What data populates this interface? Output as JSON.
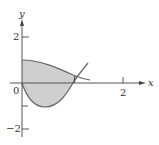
{
  "diagram": {
    "type": "region-between-curves",
    "axes": {
      "x_label": "x",
      "y_label": "y",
      "origin_label": "0",
      "x_ticks": [
        {
          "value": 2,
          "label": "2"
        }
      ],
      "y_ticks": [
        {
          "value": 2,
          "label": "2"
        },
        {
          "value": -2,
          "label": "−2"
        }
      ]
    },
    "curves": [
      {
        "name": "upper-curve",
        "description": "starts at (0,1), decreases, crosses lower curve near x≈1.05"
      },
      {
        "name": "lower-curve",
        "description": "starts at (0,0), minimum ≈ -1 near x≈0.5, rises through x-axis near x≈1.0 and continues upward"
      }
    ],
    "shaded_region": {
      "x_from": 0,
      "x_to": 1.0,
      "fill": "#cccccc"
    },
    "colors": {
      "axis": "#555555",
      "curve": "#666666",
      "shade": "#cfcfcf"
    }
  }
}
